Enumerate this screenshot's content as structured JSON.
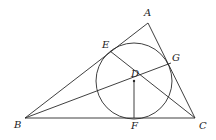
{
  "diagram": {
    "type": "geometry",
    "points": {
      "A": {
        "label": "A",
        "x": 148,
        "y": 23,
        "lx": 144,
        "ly": 16
      },
      "B": {
        "label": "B",
        "x": 25,
        "y": 118,
        "lx": 14,
        "ly": 128
      },
      "C": {
        "label": "C",
        "x": 195,
        "y": 118,
        "lx": 199,
        "ly": 129
      },
      "D": {
        "label": "D",
        "x": 134,
        "y": 81,
        "lx": 131,
        "ly": 77
      },
      "E": {
        "label": "E",
        "x": 110,
        "y": 51,
        "lx": 102,
        "ly": 48
      },
      "F": {
        "label": "F",
        "x": 134,
        "y": 118,
        "lx": 131,
        "ly": 129
      },
      "G": {
        "label": "G",
        "x": 171,
        "y": 63,
        "lx": 172,
        "ly": 61
      }
    },
    "circle": {
      "cx": 134,
      "cy": 81,
      "r": 38
    },
    "segments": [
      [
        "A",
        "B"
      ],
      [
        "B",
        "C"
      ],
      [
        "C",
        "A"
      ],
      [
        "B",
        "G"
      ],
      [
        "E",
        "C"
      ],
      [
        "D",
        "F"
      ]
    ]
  }
}
